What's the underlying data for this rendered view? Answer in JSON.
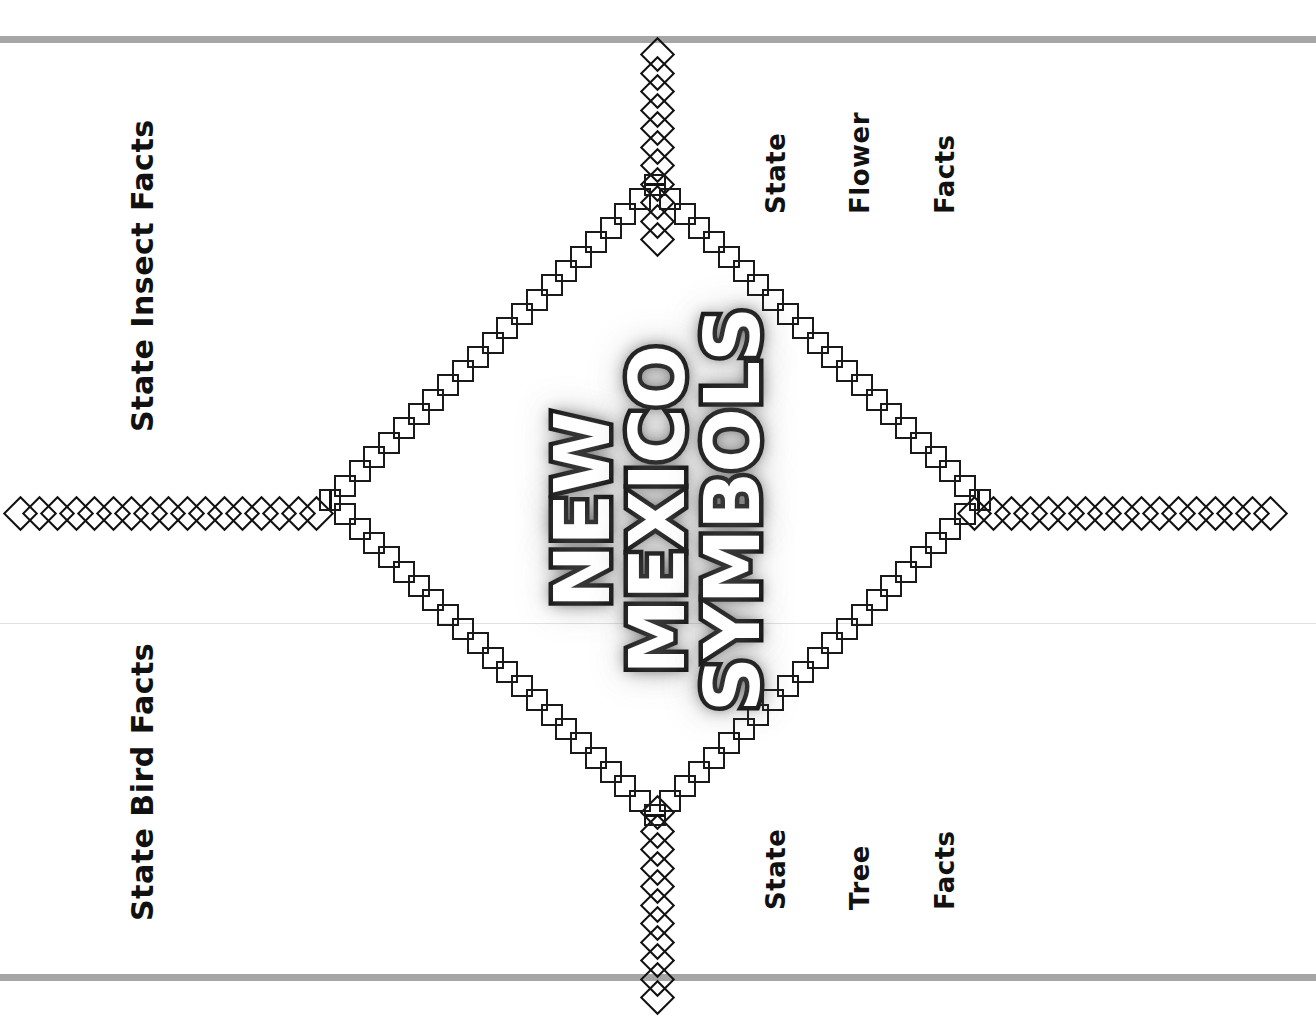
{
  "page": {
    "background_color": "#ffffff",
    "rule_color": "#a6a6a6",
    "ink_color": "#111111"
  },
  "title": {
    "lines": [
      "NEW",
      "MEXICO",
      "SYMBOLS"
    ],
    "full_text": "NEW MEXICO SYMBOLS",
    "fill_color": "#ffffff",
    "outline_color": "#0d0d0d",
    "orientation": "rotated-90-ccw"
  },
  "quadrant_labels": {
    "top_left": {
      "text": "State Insect Facts",
      "lines": [
        "State Insect Facts"
      ],
      "orientation": "rotated-90-ccw"
    },
    "bottom_left": {
      "text": "State Bird Facts",
      "lines": [
        "State Bird Facts"
      ],
      "orientation": "rotated-90-ccw"
    },
    "top_right": {
      "text": "State Flower Facts",
      "lines": [
        "State",
        "Flower",
        "Facts"
      ],
      "orientation": "rotated-90-ccw"
    },
    "bottom_right": {
      "text": "State Tree Facts",
      "lines": [
        "State",
        "Tree",
        "Facts"
      ],
      "orientation": "rotated-90-ccw"
    }
  },
  "decoration": {
    "top_rule": "horizontal-gray-rule",
    "bottom_rule": "horizontal-gray-rule",
    "middle_faint_rule": "horizontal-faint-rule",
    "chains": {
      "left": {
        "name": "diamond-chain-left",
        "count": 17
      },
      "right": {
        "name": "diamond-chain-right",
        "count": 17
      },
      "top": {
        "name": "diamond-chain-top",
        "count": 11
      },
      "bottom": {
        "name": "diamond-chain-bottom",
        "count": 11
      }
    },
    "rhombus": {
      "name": "square-border-rhombus",
      "vertices": {
        "top": [
          655,
          200
        ],
        "right": [
          963,
          512
        ],
        "bottom": [
          655,
          800
        ],
        "left": [
          345,
          512
        ]
      },
      "squares_per_edge": 22
    }
  }
}
